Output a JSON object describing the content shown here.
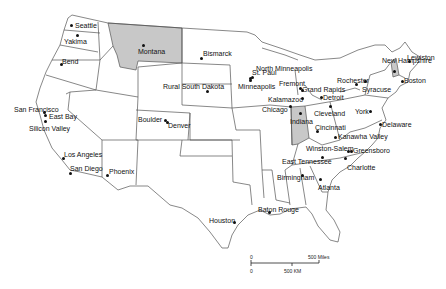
{
  "map": {
    "title": "",
    "highlighted_states": [
      "Montana",
      "Indiana",
      "New Hampshire"
    ],
    "highlight_color": "#c8c8c8",
    "border_color": "#555555",
    "cities": [
      {
        "label": "Seattle",
        "x": 71,
        "y": 25,
        "lx": 75,
        "ly": 22
      },
      {
        "label": "Yakima",
        "x": 77,
        "y": 35,
        "lx": 64,
        "ly": 38
      },
      {
        "label": "Bend",
        "x": 61,
        "y": 64,
        "lx": 62,
        "ly": 58
      },
      {
        "label": "Montana",
        "x": 143,
        "y": 45,
        "lx": 138,
        "ly": 48
      },
      {
        "label": "Bismarck",
        "x": 201,
        "y": 58,
        "lx": 203,
        "ly": 50
      },
      {
        "label": "Rural South Dakota",
        "x": 207,
        "y": 91,
        "lx": 163,
        "ly": 83
      },
      {
        "label": "North Minneapolis",
        "x": 250,
        "y": 78,
        "lx": 256,
        "ly": 65
      },
      {
        "label": "St. Paul",
        "x": 252,
        "y": 77,
        "lx": 252,
        "ly": 69
      },
      {
        "label": "Minneapolis",
        "x": 250,
        "y": 80,
        "lx": 238,
        "ly": 83
      },
      {
        "label": "Fremont",
        "x": 300,
        "y": 88,
        "lx": 279,
        "ly": 80
      },
      {
        "label": "Grand Rapids",
        "x": 302,
        "y": 90,
        "lx": 302,
        "ly": 86
      },
      {
        "label": "Kalamazoo",
        "x": 302,
        "y": 98,
        "lx": 268,
        "ly": 96
      },
      {
        "label": "Detroit",
        "x": 321,
        "y": 97,
        "lx": 323,
        "ly": 94
      },
      {
        "label": "Chicago",
        "x": 290,
        "y": 106,
        "lx": 262,
        "ly": 106
      },
      {
        "label": "Indiana",
        "x": 300,
        "y": 113,
        "lx": 290,
        "ly": 118
      },
      {
        "label": "Cleveland",
        "x": 330,
        "y": 106,
        "lx": 314,
        "ly": 110
      },
      {
        "label": "Cincinnati",
        "x": 317,
        "y": 131,
        "lx": 315,
        "ly": 124
      },
      {
        "label": "Rochester",
        "x": 356,
        "y": 84,
        "lx": 337,
        "ly": 77
      },
      {
        "label": "Syracuse",
        "x": 365,
        "y": 81,
        "lx": 362,
        "ly": 86
      },
      {
        "label": "York",
        "x": 370,
        "y": 111,
        "lx": 355,
        "ly": 108
      },
      {
        "label": "New Hampshire",
        "x": 394,
        "y": 71,
        "lx": 382,
        "ly": 57
      },
      {
        "label": "Lewiston",
        "x": 409,
        "y": 61,
        "lx": 407,
        "ly": 54
      },
      {
        "label": "Boston",
        "x": 402,
        "y": 81,
        "lx": 404,
        "ly": 77
      },
      {
        "label": "Delaware",
        "x": 380,
        "y": 124,
        "lx": 382,
        "ly": 121
      },
      {
        "label": "Kanawha Valley",
        "x": 335,
        "y": 137,
        "lx": 338,
        "ly": 133
      },
      {
        "label": "Winston-Salem",
        "x": 348,
        "y": 151,
        "lx": 306,
        "ly": 145
      },
      {
        "label": "Greensboro",
        "x": 351,
        "y": 151,
        "lx": 353,
        "ly": 147
      },
      {
        "label": "East Tennessee",
        "x": 322,
        "y": 157,
        "lx": 282,
        "ly": 158
      },
      {
        "label": "Charlotte",
        "x": 345,
        "y": 158,
        "lx": 347,
        "ly": 164
      },
      {
        "label": "Birmingham",
        "x": 302,
        "y": 175,
        "lx": 277,
        "ly": 174
      },
      {
        "label": "Atlanta",
        "x": 320,
        "y": 179,
        "lx": 318,
        "ly": 184
      },
      {
        "label": "Baton Rouge",
        "x": 269,
        "y": 212,
        "lx": 258,
        "ly": 206
      },
      {
        "label": "Houston",
        "x": 234,
        "y": 222,
        "lx": 209,
        "ly": 217
      },
      {
        "label": "Boulder",
        "x": 165,
        "y": 120,
        "lx": 138,
        "ly": 116
      },
      {
        "label": "Denver",
        "x": 167,
        "y": 122,
        "lx": 168,
        "ly": 122
      },
      {
        "label": "San Francisco",
        "x": 44,
        "y": 112,
        "lx": 14,
        "ly": 106
      },
      {
        "label": "East Bay",
        "x": 45,
        "y": 115,
        "lx": 49,
        "ly": 113
      },
      {
        "label": "Silicon Valley",
        "x": 45,
        "y": 121,
        "lx": 29,
        "ly": 125
      },
      {
        "label": "Los Angeles",
        "x": 63,
        "y": 158,
        "lx": 64,
        "ly": 151
      },
      {
        "label": "San Diego",
        "x": 70,
        "y": 173,
        "lx": 70,
        "ly": 165
      },
      {
        "label": "Phoenix",
        "x": 107,
        "y": 175,
        "lx": 109,
        "ly": 168
      }
    ],
    "scale_bar": {
      "miles_start": "0",
      "miles_end": "500 Miles",
      "km_start": "0",
      "km_end": "500 KM"
    }
  }
}
